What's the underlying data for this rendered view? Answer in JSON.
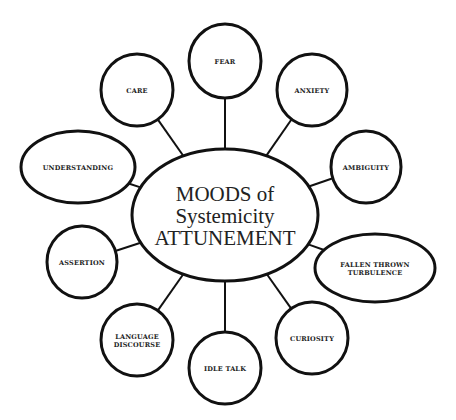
{
  "diagram": {
    "center": {
      "lines": [
        "MOODS of",
        "Systemicity",
        "ATTUNEMENT"
      ]
    },
    "nodes": [
      {
        "id": "fear",
        "lines": [
          "FEAR"
        ]
      },
      {
        "id": "care",
        "lines": [
          "CARE"
        ]
      },
      {
        "id": "anxiety",
        "lines": [
          "ANXIETY"
        ]
      },
      {
        "id": "understanding",
        "lines": [
          "UNDERSTANDING"
        ]
      },
      {
        "id": "ambiguity",
        "lines": [
          "AMBIGUITY"
        ]
      },
      {
        "id": "assertion",
        "lines": [
          "ASSERTION"
        ]
      },
      {
        "id": "fallen-thrown-turbulence",
        "lines": [
          "FALLEN THROWN",
          "TURBULENCE"
        ]
      },
      {
        "id": "language-discourse",
        "lines": [
          "LANGUAGE",
          "DISCOURSE"
        ]
      },
      {
        "id": "idle-talk",
        "lines": [
          "IDLE TALK"
        ]
      },
      {
        "id": "curiosity",
        "lines": [
          "CURIOSITY"
        ]
      }
    ]
  }
}
